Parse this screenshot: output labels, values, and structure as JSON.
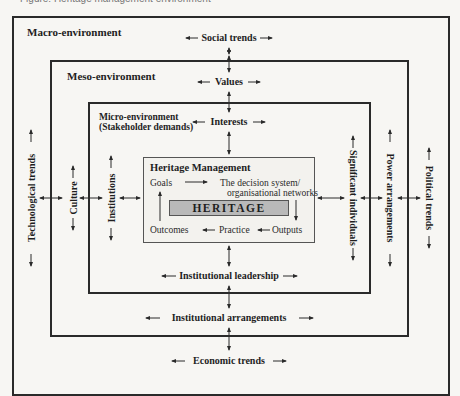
{
  "caption": "Figure: Heritage management environment",
  "levels": {
    "macro": {
      "title": "Macro-environment",
      "top": "Social trends",
      "bottom": "Economic trends",
      "left": "Technological trends",
      "right": "Political trends"
    },
    "meso": {
      "title": "Meso-environment",
      "top": "Values",
      "bottom": "Institutional arrangements",
      "left": "Culture",
      "right": "Power arrangements"
    },
    "micro": {
      "title": "Micro-environment",
      "subtitle": "(Stakeholder demands)",
      "top": "Interests",
      "bottom": "Institutional leadership",
      "left": "Institutions",
      "right": "Significant individuals"
    }
  },
  "heritage_management": {
    "title": "Heritage Management",
    "goals": "Goals",
    "decision_line1": "The decision system/",
    "decision_line2": "organisational networks",
    "core": "HERITAGE",
    "outcomes": "Outcomes",
    "practice": "Practice",
    "outputs": "Outputs"
  },
  "colors": {
    "line": "#2a2a2a",
    "core_fill": "#b9b9b9",
    "background": "#f7f6f3"
  }
}
